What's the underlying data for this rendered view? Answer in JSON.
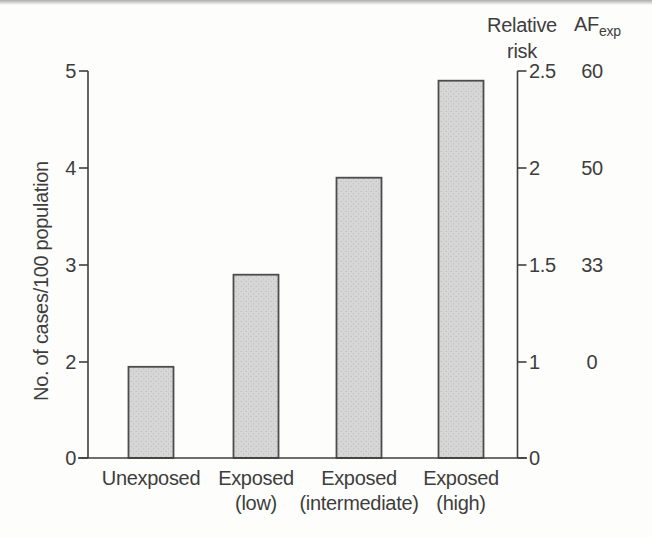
{
  "chart_data": {
    "type": "bar",
    "title": "",
    "ylabel": "No. of cases/100 population",
    "ylim": [
      0,
      5
    ],
    "categories": [
      "Unexposed",
      "Exposed (low)",
      "Exposed (intermediate)",
      "Exposed (high)"
    ],
    "category_lines": [
      [
        "Unexposed",
        ""
      ],
      [
        "Exposed",
        "(low)"
      ],
      [
        "Exposed",
        "(intermediate)"
      ],
      [
        "Exposed",
        "(high)"
      ]
    ],
    "values": [
      1.9,
      2.9,
      3.9,
      4.9
    ],
    "left_axis_ticks": [
      {
        "label": "5",
        "value": 5
      },
      {
        "label": "4",
        "value": 4
      },
      {
        "label": "3",
        "value": 3
      },
      {
        "label": "2",
        "value": 2
      },
      {
        "label": "0",
        "value": 0
      }
    ],
    "right_axis": {
      "title_lines": [
        "Relative",
        "risk"
      ],
      "ticks": [
        {
          "label": "2.5",
          "value": 2.5
        },
        {
          "label": "2",
          "value": 2
        },
        {
          "label": "1.5",
          "value": 1.5
        },
        {
          "label": "1",
          "value": 1
        },
        {
          "label": "0",
          "value": 0
        }
      ]
    },
    "af_exp_column": {
      "title_main": "AF",
      "title_sub": "exp",
      "values": [
        {
          "label": "60",
          "at_relative_risk": 2.5
        },
        {
          "label": "50",
          "at_relative_risk": 2
        },
        {
          "label": "33",
          "at_relative_risk": 1.5
        },
        {
          "label": "0",
          "at_relative_risk": 1
        }
      ]
    },
    "colors": {
      "background": "#fdfdfc",
      "text": "#3d3d3d",
      "axis": "#3f3f3f",
      "bar_fill": "#d7d7d7",
      "bar_stipple": "#b9b9b9",
      "bar_border": "#4c4c4c"
    }
  }
}
